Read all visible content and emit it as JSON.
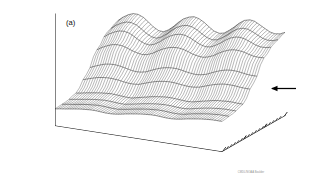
{
  "figure": {
    "panel_label": "(a)",
    "credit": "CMDL/NOAA Boulder",
    "background_color": "#ffffff",
    "ink_color": "#141414"
  },
  "annotation": {
    "arrow": "left-arrow",
    "arrow_label": ""
  },
  "chart_data": {
    "type": "line",
    "render": "3d-wireframe-surface",
    "title": "",
    "subtitle": "",
    "panel": "(a)",
    "zlabel": "CH4 (ppb)",
    "zlabel_display": "CH₄ (ppb)",
    "zlim": [
      1500,
      1800
    ],
    "z_major_ticks": [
      1500,
      1600,
      1700,
      1800
    ],
    "z_tick_labels": [
      "1500",
      "1600",
      "1700",
      "1800"
    ],
    "z_minor_step": 25,
    "xlabel": "",
    "x_tick_labels": [
      "1984",
      "1985"
    ],
    "x_tick_values": [
      1984,
      1985
    ],
    "xlim": [
      1983.0,
      1985.75
    ],
    "x_minor_step_months": 1,
    "ylabel": "LATITUDE  (deg)",
    "y_tick_labels": [
      "S 90",
      "30",
      "30",
      "90 N"
    ],
    "y_tick_values": [
      -90,
      -30,
      30,
      90
    ],
    "ylim": [
      -90,
      90
    ],
    "y_minor_step": 10,
    "grid": false,
    "legend": null,
    "latitudes": [
      -90,
      -80,
      -70,
      -60,
      -50,
      -40,
      -30,
      -20,
      -10,
      0,
      10,
      20,
      30,
      40,
      50,
      60,
      70,
      80,
      90
    ],
    "times": [
      1983.0,
      1983.08,
      1983.17,
      1983.25,
      1983.33,
      1983.42,
      1983.5,
      1983.58,
      1983.67,
      1983.75,
      1983.83,
      1983.92,
      1984.0,
      1984.08,
      1984.17,
      1984.25,
      1984.33,
      1984.42,
      1984.5,
      1984.58,
      1984.67,
      1984.75,
      1984.83,
      1984.92,
      1985.0,
      1985.08,
      1985.17,
      1985.25,
      1985.33,
      1985.42,
      1985.5,
      1985.58,
      1985.67,
      1985.75
    ],
    "series": [
      {
        "name": "90S",
        "latitude": -90,
        "values": [
          1546,
          1548,
          1550,
          1552,
          1554,
          1556,
          1557,
          1558,
          1558,
          1557,
          1556,
          1556,
          1557,
          1559,
          1562,
          1564,
          1566,
          1568,
          1569,
          1570,
          1570,
          1569,
          1568,
          1568,
          1569,
          1571,
          1574,
          1576,
          1578,
          1580,
          1581,
          1582,
          1582,
          1582
        ]
      },
      {
        "name": "60S",
        "latitude": -60,
        "values": [
          1548,
          1550,
          1552,
          1554,
          1556,
          1558,
          1559,
          1560,
          1560,
          1559,
          1558,
          1558,
          1560,
          1562,
          1565,
          1567,
          1569,
          1571,
          1572,
          1573,
          1573,
          1572,
          1571,
          1571,
          1572,
          1575,
          1578,
          1580,
          1582,
          1584,
          1585,
          1586,
          1586,
          1586
        ]
      },
      {
        "name": "30S",
        "latitude": -30,
        "values": [
          1556,
          1558,
          1561,
          1563,
          1565,
          1567,
          1568,
          1569,
          1568,
          1567,
          1566,
          1566,
          1569,
          1572,
          1575,
          1578,
          1580,
          1582,
          1583,
          1583,
          1582,
          1581,
          1580,
          1581,
          1584,
          1587,
          1590,
          1593,
          1595,
          1596,
          1597,
          1597,
          1596,
          1596
        ]
      },
      {
        "name": "EQ",
        "latitude": 0,
        "values": [
          1590,
          1595,
          1600,
          1604,
          1606,
          1607,
          1606,
          1604,
          1601,
          1599,
          1599,
          1601,
          1606,
          1611,
          1616,
          1619,
          1621,
          1622,
          1621,
          1619,
          1617,
          1616,
          1617,
          1620,
          1625,
          1630,
          1635,
          1638,
          1640,
          1640,
          1639,
          1637,
          1636,
          1636
        ]
      },
      {
        "name": "30N",
        "latitude": 30,
        "values": [
          1640,
          1648,
          1655,
          1660,
          1662,
          1661,
          1657,
          1652,
          1648,
          1646,
          1648,
          1654,
          1662,
          1669,
          1675,
          1678,
          1679,
          1677,
          1673,
          1668,
          1665,
          1664,
          1667,
          1673,
          1681,
          1688,
          1694,
          1697,
          1697,
          1695,
          1691,
          1688,
          1687,
          1688
        ]
      },
      {
        "name": "60N",
        "latitude": 60,
        "values": [
          1672,
          1682,
          1690,
          1695,
          1696,
          1692,
          1684,
          1675,
          1668,
          1666,
          1671,
          1681,
          1692,
          1701,
          1708,
          1711,
          1710,
          1704,
          1696,
          1689,
          1685,
          1687,
          1694,
          1704,
          1714,
          1722,
          1727,
          1727,
          1723,
          1716,
          1710,
          1707,
          1708,
          1712
        ]
      },
      {
        "name": "90N",
        "latitude": 90,
        "values": [
          1686,
          1697,
          1706,
          1711,
          1711,
          1705,
          1695,
          1684,
          1676,
          1675,
          1682,
          1694,
          1707,
          1718,
          1725,
          1728,
          1725,
          1717,
          1707,
          1698,
          1694,
          1697,
          1706,
          1718,
          1730,
          1739,
          1743,
          1741,
          1734,
          1726,
          1719,
          1716,
          1718,
          1724
        ]
      }
    ],
    "notes": [
      "Seasonal cycle amplitude increases toward high northern latitudes",
      "Secular increase of roughly 15-17 ppb per year",
      "Surface converges to a single point at the front-left origin corner"
    ]
  }
}
